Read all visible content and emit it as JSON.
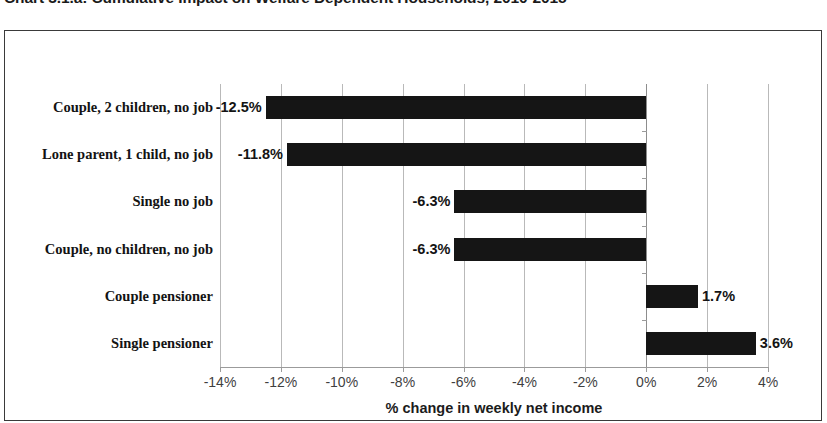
{
  "chart_title": "Chart 3.1.a: Cumulative Impact on Welfare Dependent Households, 2010-2015",
  "axis": {
    "x_title": "% change in weekly net income",
    "ticks": [
      "-14%",
      "-12%",
      "-10%",
      "-8%",
      "-6%",
      "-4%",
      "-2%",
      "0%",
      "2%",
      "4%"
    ]
  },
  "colors": {
    "bar": "#151515",
    "gridline": "#b9b9b9",
    "frame": "#3a3a3a"
  },
  "chart_data": {
    "type": "bar",
    "orientation": "horizontal",
    "title": "Chart 3.1.a: Cumulative Impact on Welfare Dependent Households, 2010-2015",
    "xlabel": "% change in weekly net income",
    "ylabel": "",
    "xlim": [
      -14,
      4
    ],
    "xticks": [
      -14,
      -12,
      -10,
      -8,
      -6,
      -4,
      -2,
      0,
      2,
      4
    ],
    "xtick_labels": [
      "-14%",
      "-12%",
      "-10%",
      "-8%",
      "-6%",
      "-4%",
      "-2%",
      "0%",
      "2%",
      "4%"
    ],
    "grid": true,
    "legend": false,
    "categories": [
      "Couple, 2 children, no job",
      "Lone parent, 1 child, no job",
      "Single no job",
      "Couple, no children, no job",
      "Couple pensioner",
      "Single pensioner"
    ],
    "values": [
      -12.5,
      -11.8,
      -6.3,
      -6.3,
      1.7,
      3.6
    ],
    "data_labels": [
      "-12.5%",
      "-11.8%",
      "-6.3%",
      "-6.3%",
      "1.7%",
      "3.6%"
    ]
  }
}
